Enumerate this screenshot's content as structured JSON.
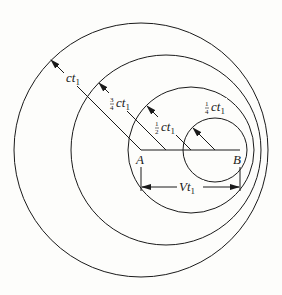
{
  "diagram": {
    "colors": {
      "stroke": "#1a1a1a",
      "background": "#fdfdfb"
    },
    "points": {
      "A": {
        "label": "A"
      },
      "B": {
        "label": "B"
      }
    },
    "circles": [
      {
        "name": "wavefront-full",
        "radius_label": {
          "coef": "",
          "var": "ct",
          "sub": "1"
        }
      },
      {
        "name": "wavefront-three-quarter",
        "radius_label": {
          "coef_num": "3",
          "coef_den": "4",
          "var": "ct",
          "sub": "1"
        }
      },
      {
        "name": "wavefront-half",
        "radius_label": {
          "coef_num": "1",
          "coef_den": "2",
          "var": "ct",
          "sub": "1"
        }
      },
      {
        "name": "wavefront-quarter",
        "radius_label": {
          "coef_num": "1",
          "coef_den": "4",
          "var": "ct",
          "sub": "1"
        }
      }
    ],
    "dimension": {
      "var": "Vt",
      "sub": "1"
    }
  }
}
